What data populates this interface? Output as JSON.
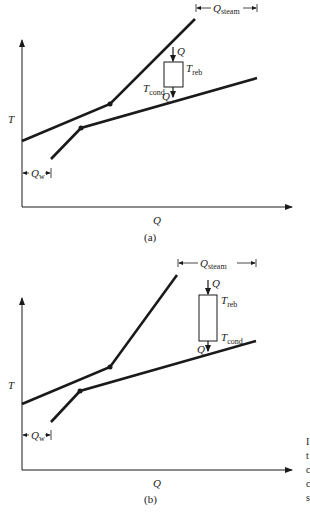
{
  "panels": [
    {
      "id": "a",
      "caption": "(a)",
      "x_axis_label": "Q",
      "y_axis_label": "T",
      "q_steam_label": "Q",
      "q_steam_sub": "steam",
      "q_w_label": "Q",
      "q_w_sub": "w",
      "heat_in_label": "Q",
      "heat_out_label": "Q",
      "t_reb_label": "T",
      "t_reb_sub": "reb",
      "t_cond_label": "T",
      "t_cond_sub": "cond"
    },
    {
      "id": "b",
      "caption": "(b)",
      "x_axis_label": "Q",
      "y_axis_label": "T",
      "q_steam_label": "Q",
      "q_steam_sub": "steam",
      "q_w_label": "Q",
      "q_w_sub": "w",
      "heat_in_label": "Q",
      "heat_out_label": "Q",
      "t_reb_label": "T",
      "t_reb_sub": "reb",
      "t_cond_label": "T",
      "t_cond_sub": "cond"
    }
  ],
  "clipped_caption_fragments": [
    "I",
    "t",
    "c",
    "c",
    "s"
  ]
}
